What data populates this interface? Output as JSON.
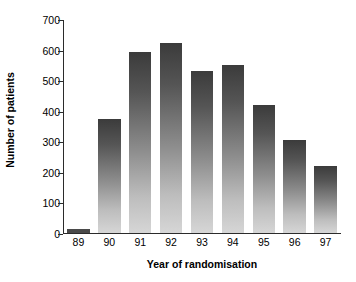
{
  "chart_data": {
    "type": "bar",
    "title": "",
    "subtitle": "",
    "xlabel": "Year of randomisation",
    "ylabel": "Number of patients",
    "categories": [
      "89",
      "90",
      "91",
      "92",
      "93",
      "94",
      "95",
      "96",
      "97"
    ],
    "values": [
      15,
      375,
      597,
      625,
      532,
      553,
      423,
      307,
      222
    ],
    "series": [
      {
        "name": "Number of patients",
        "values": [
          15,
          375,
          597,
          625,
          532,
          553,
          423,
          307,
          222
        ]
      }
    ],
    "ylim": [
      0,
      700
    ],
    "ytick_labels": [
      "0",
      "100",
      "200",
      "300",
      "400",
      "500",
      "600",
      "700"
    ],
    "ytick_values": [
      0,
      100,
      200,
      300,
      400,
      500,
      600,
      700
    ],
    "grid": false,
    "legend": null,
    "legend_position": "none",
    "annotations": [],
    "bar_fill": "vertical-gradient-dark-to-light",
    "bar_color_top": "#3b3b3b",
    "bar_color_bottom": "#d6d6d6",
    "axis_color": "#2b2b2b",
    "background_color": "#ffffff"
  }
}
